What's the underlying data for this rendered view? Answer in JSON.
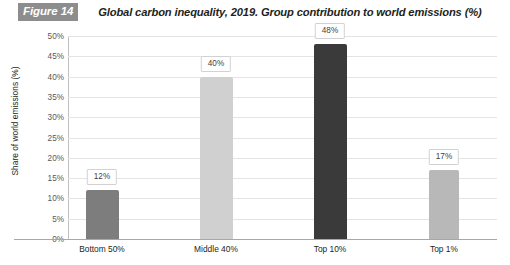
{
  "header": {
    "badge": "Figure 14",
    "title": "Global carbon inequality, 2019. Group contribution to world emissions (%)"
  },
  "chart_data": {
    "type": "bar",
    "title": "Global carbon inequality, 2019. Group contribution to world emissions (%)",
    "xlabel": "",
    "ylabel": "Share of world emissions (%)",
    "categories": [
      "Bottom 50%",
      "Middle 40%",
      "Top 10%",
      "Top 1%"
    ],
    "values": [
      12,
      40,
      48,
      17
    ],
    "value_labels": [
      "12%",
      "40%",
      "48%",
      "17%"
    ],
    "bar_colors": [
      "#7d7d7d",
      "#d0d0d0",
      "#3a3a3a",
      "#b8b8b8"
    ],
    "ylim": [
      0,
      50
    ],
    "ytick_labels": [
      "50%",
      "45%",
      "40%",
      "35%",
      "30%",
      "25%",
      "20%",
      "15%",
      "10%",
      "5%",
      "0%"
    ],
    "ytick_values": [
      50,
      45,
      40,
      35,
      30,
      25,
      20,
      15,
      10,
      5,
      0
    ],
    "grid": true,
    "legend": "none"
  },
  "colors": {
    "badge_background": "#8d8d8d",
    "badge_text": "#ffffff",
    "gridline": "#e4e4e4",
    "axis": "#a8a8a8",
    "text": "#231f20",
    "tick_text": "#58595b"
  }
}
